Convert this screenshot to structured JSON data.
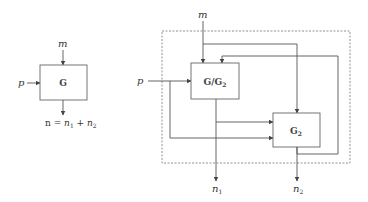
{
  "left_diagram": {
    "block": "G",
    "inputs": {
      "top": "m",
      "left": "p"
    },
    "output_equation": {
      "lhs": "n",
      "eq": "=",
      "t1": "n",
      "s1": "1",
      "plus": "+",
      "t2": "n",
      "s2": "2"
    }
  },
  "right_diagram": {
    "block1": {
      "main": "G/G",
      "sub": "2"
    },
    "block2": {
      "main": "G",
      "sub": "2"
    },
    "inputs": {
      "top": "m",
      "left": "p"
    },
    "outputs": [
      {
        "label": "n",
        "sub": "1"
      },
      {
        "label": "n",
        "sub": "2"
      }
    ]
  }
}
